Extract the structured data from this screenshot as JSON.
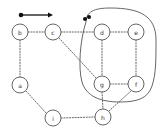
{
  "figure": {
    "kind": "graph-diagram",
    "background": "#ffffff",
    "stroke_color": "#555555",
    "node_fill": "#ffffff",
    "node_stroke": "#555555",
    "label_color": "#333333",
    "marker_color": "#111111",
    "edge_style": "dotted",
    "enclosure_style": "solid"
  },
  "legend": {
    "name": "arrow-legend",
    "dot": {
      "cx": 21,
      "cy": 15,
      "r": 2.3
    },
    "line": {
      "x1": 21,
      "y1": 15,
      "x2": 52,
      "y2": 15
    },
    "arrowhead": {
      "x": 53,
      "y": 15
    }
  },
  "nodes": [
    {
      "id": "b",
      "label": "b",
      "cx": 20,
      "cy": 32,
      "r": 8
    },
    {
      "id": "c",
      "label": "c",
      "cx": 53,
      "cy": 32,
      "r": 8
    },
    {
      "id": "d",
      "label": "d",
      "cx": 102,
      "cy": 32,
      "r": 8
    },
    {
      "id": "e",
      "label": "e",
      "cx": 136,
      "cy": 32,
      "r": 8
    },
    {
      "id": "a",
      "label": "a",
      "cx": 20,
      "cy": 85,
      "r": 8
    },
    {
      "id": "g",
      "label": "g",
      "cx": 102,
      "cy": 84,
      "r": 8
    },
    {
      "id": "f",
      "label": "f",
      "cx": 136,
      "cy": 84,
      "r": 8
    },
    {
      "id": "h",
      "label": "h",
      "cx": 103,
      "cy": 117,
      "r": 8
    },
    {
      "id": "i",
      "label": "i",
      "cx": 53,
      "cy": 118,
      "r": 8
    }
  ],
  "edges": [
    {
      "id": "b-c",
      "from": "b",
      "to": "c",
      "x1": 28,
      "y1": 32,
      "x2": 45,
      "y2": 32
    },
    {
      "id": "c-d",
      "from": "c",
      "to": "d",
      "x1": 61,
      "y1": 32,
      "x2": 94,
      "y2": 32
    },
    {
      "id": "d-e",
      "from": "d",
      "to": "e",
      "x1": 110,
      "y1": 32,
      "x2": 128,
      "y2": 32
    },
    {
      "id": "b-a",
      "from": "b",
      "to": "a",
      "x1": 20,
      "y1": 40,
      "x2": 20,
      "y2": 77
    },
    {
      "id": "d-g",
      "from": "d",
      "to": "g",
      "x1": 102,
      "y1": 40,
      "x2": 102,
      "y2": 76
    },
    {
      "id": "e-f",
      "from": "e",
      "to": "f",
      "x1": 136,
      "y1": 40,
      "x2": 136,
      "y2": 76
    },
    {
      "id": "g-f",
      "from": "g",
      "to": "f",
      "x1": 110,
      "y1": 84,
      "x2": 128,
      "y2": 84
    },
    {
      "id": "c-g",
      "from": "c",
      "to": "g",
      "x1": 59,
      "y1": 38,
      "x2": 96,
      "y2": 78
    },
    {
      "id": "a-i",
      "from": "a",
      "to": "i",
      "x1": 26,
      "y1": 91,
      "x2": 46,
      "y2": 113
    },
    {
      "id": "i-h",
      "from": "i",
      "to": "h",
      "x1": 61,
      "y1": 118,
      "x2": 95,
      "y2": 117
    },
    {
      "id": "g-h",
      "from": "g",
      "to": "h",
      "x1": 102,
      "y1": 92,
      "x2": 103,
      "y2": 109
    },
    {
      "id": "h-f",
      "from": "h",
      "to": "f",
      "x1": 109,
      "y1": 111,
      "x2": 131,
      "y2": 91
    }
  ],
  "enclosure": {
    "name": "group-boundary",
    "members": [
      "d",
      "e",
      "g",
      "f"
    ],
    "path": "M 86 22 C 86 12 94 8 110 8 C 140 8 156 16 156 40 C 156 60 156 74 152 86 C 148 98 138 102 120 102 C 100 102 86 96 82 82 C 78 68 80 40 86 22 Z"
  },
  "markers": [
    {
      "id": "marker-1",
      "cx": 85,
      "cy": 19,
      "r": 2.0
    },
    {
      "id": "marker-2",
      "cx": 89,
      "cy": 17,
      "r": 2.0
    }
  ]
}
